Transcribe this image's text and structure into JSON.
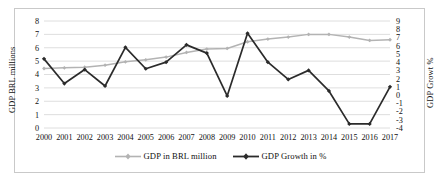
{
  "figure": {
    "background": "#ffffff",
    "border_color": "#c9c9c9"
  },
  "axis_titles": {
    "left": "GDP BRL millions",
    "right": "GDP Growt %"
  },
  "legend": {
    "position": "bottom-center",
    "entries": [
      {
        "label": "GDP in BRL million",
        "color": "#b3b3b3",
        "marker": "diamond"
      },
      {
        "label": "GDP Growth in %",
        "color": "#2b2b2b",
        "marker": "diamond"
      }
    ]
  },
  "chart_data": {
    "type": "line",
    "title": "",
    "xlabel": "",
    "ylabel": "GDP BRL millions",
    "y2label": "GDP Growt %",
    "grid": true,
    "categories": [
      "2000",
      "2001",
      "2002",
      "2003",
      "2004",
      "2005",
      "2006",
      "2007",
      "2008",
      "2009",
      "2010",
      "2011",
      "2012",
      "2013",
      "2014",
      "2015",
      "2016",
      "2017"
    ],
    "ylim": [
      0,
      8
    ],
    "yticks": [
      0,
      1,
      2,
      3,
      4,
      5,
      6,
      7,
      8
    ],
    "y2lim": [
      -4,
      9
    ],
    "y2ticks": [
      -4,
      -3,
      -2,
      -1,
      0,
      1,
      2,
      3,
      4,
      5,
      6,
      7,
      8,
      9
    ],
    "series": [
      {
        "name": "GDP in BRL million",
        "axis": "left",
        "color": "#b3b3b3",
        "values": [
          4.45,
          4.5,
          4.55,
          4.7,
          4.95,
          5.1,
          5.3,
          5.65,
          5.9,
          5.95,
          6.45,
          6.65,
          6.8,
          7.0,
          7.0,
          6.8,
          6.55,
          6.6
        ]
      },
      {
        "name": "GDP Growth in %",
        "axis": "right",
        "color": "#2b2b2b",
        "values": [
          4.4,
          1.4,
          3.1,
          1.1,
          5.8,
          3.2,
          4.0,
          6.1,
          5.1,
          -0.1,
          7.5,
          4.0,
          1.9,
          3.0,
          0.5,
          -3.5,
          -3.5,
          1.0
        ]
      }
    ]
  }
}
